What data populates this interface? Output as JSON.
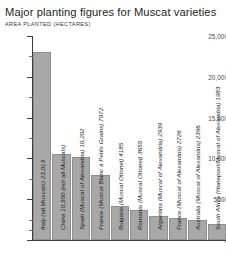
{
  "chart_data": {
    "type": "bar",
    "title": "Major planting figures for Muscat varieties",
    "subtitle": "AREA PLANTED (HECTARES)",
    "xlabel": "",
    "ylabel": "AREA PLANTED (HECTARES)",
    "ylim": [
      0,
      25000
    ],
    "grid": false,
    "legend": "none",
    "orientation": "vertical",
    "bar_color": "#a8a8a8",
    "y_ticks": [
      {
        "value": 25000,
        "label": "25,000"
      },
      {
        "value": 20000,
        "label": "20,000"
      },
      {
        "value": 15000,
        "label": "15,000"
      },
      {
        "value": 10000,
        "label": "10,000"
      },
      {
        "value": 5000,
        "label": "5000"
      },
      {
        "value": 0,
        "label": "0"
      }
    ],
    "y_minor_ticks": [
      22500,
      17500,
      12500,
      7500,
      2500,
      1250
    ],
    "categories": [
      "Italy (all Muscats)",
      "China (not all Muscats)",
      "Spain (Muscat of Alexandria)",
      "France (Muscat Blanc à Petits Grains)",
      "Bulgaria (Muscat Ottonel)",
      "Romania (Muscat Ottonel)",
      "Argentina (Muscat of Alexandria)",
      "France (Muscat of Alexandria)",
      "Australia (Muscat of Alexandria)",
      "South Africa (Hanepoot/Muscat of Alexandria)"
    ],
    "values": [
      23013,
      10500,
      10202,
      7972,
      4185,
      3655,
      2939,
      2726,
      2396,
      1983
    ],
    "bars": [
      {
        "label": "Italy (all Muscats) 23,013",
        "value": 23013
      },
      {
        "label": "China 10,500 (not all Muscats)",
        "value": 10500
      },
      {
        "label": "Spain (Muscat of Alexandria) 10,202",
        "value": 10202
      },
      {
        "label": "France (Muscat Blanc à Petits Grains) 7972",
        "value": 7972
      },
      {
        "label": "Bulgaria (Muscat Ottonel) 4185",
        "value": 4185
      },
      {
        "label": "Romania (Muscat Ottonel) 3655",
        "value": 3655
      },
      {
        "label": "Argentina (Muscat of Alexandria) 2939",
        "value": 2939
      },
      {
        "label": "France (Muscat of Alexandria) 2726",
        "value": 2726
      },
      {
        "label": "Australia (Muscat of Alexandria) 2396",
        "value": 2396
      },
      {
        "label": "South Africa (Hanepoot/Muscat of Alexandria) 1983",
        "value": 1983
      }
    ]
  }
}
